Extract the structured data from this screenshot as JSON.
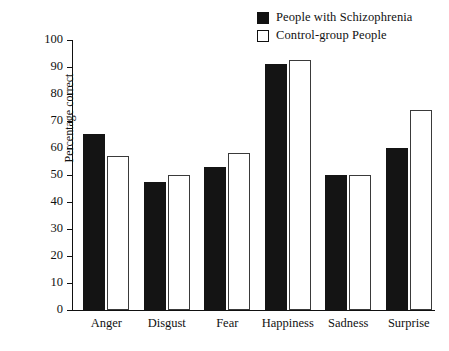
{
  "chart_data": {
    "type": "bar",
    "title": "",
    "xlabel": "",
    "ylabel": "Percentage correct",
    "ylim": [
      0,
      100
    ],
    "ytick_step": 10,
    "yticks": [
      100,
      90,
      80,
      70,
      60,
      50,
      40,
      30,
      20,
      10,
      0
    ],
    "grid": false,
    "legend_position": "top-right",
    "categories": [
      "Anger",
      "Disgust",
      "Fear",
      "Happiness",
      "Sadness",
      "Surprise"
    ],
    "series": [
      {
        "name": "People with Schizophrenia",
        "color": "#141414",
        "style": "filled",
        "values": [
          65,
          47.5,
          53,
          91,
          50,
          60
        ]
      },
      {
        "name": "Control-group People",
        "color": "#ffffff",
        "style": "outlined",
        "values": [
          57,
          50,
          58,
          92.5,
          50,
          74
        ]
      }
    ]
  },
  "legend": {
    "items": [
      {
        "label": "People with Schizophrenia",
        "swatch": "filled-square-icon"
      },
      {
        "label": "Control-group People",
        "swatch": "hollow-square-icon"
      }
    ]
  },
  "axis": {
    "y_title": "Percentage correct",
    "y_tick_labels": [
      "100",
      "90",
      "80",
      "70",
      "60",
      "50",
      "40",
      "30",
      "20",
      "10",
      "0"
    ],
    "x_tick_labels": [
      "Anger",
      "Disgust",
      "Fear",
      "Happiness",
      "Sadness",
      "Surprise"
    ]
  }
}
